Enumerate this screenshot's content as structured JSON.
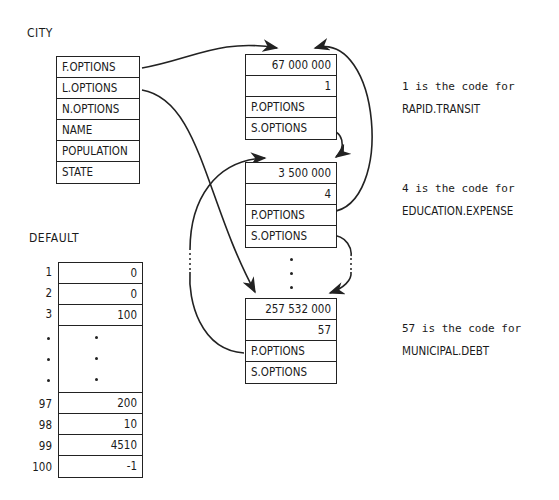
{
  "city": {
    "title": "CITY",
    "fields": [
      "F.OPTIONS",
      "L.OPTIONS",
      "N.OPTIONS",
      "NAME",
      "POPULATION",
      "STATE"
    ]
  },
  "options": [
    {
      "amount": "67 000 000",
      "code": "1",
      "p": "P.OPTIONS",
      "s": "S.OPTIONS",
      "note_l1": "1 is the code for",
      "note_l2": "RAPID.TRANSIT"
    },
    {
      "amount": "3 500 000",
      "code": "4",
      "p": "P.OPTIONS",
      "s": "S.OPTIONS",
      "note_l1": "4 is the code for",
      "note_l2": "EDUCATION.EXPENSE"
    },
    {
      "amount": "257 532 000",
      "code": "57",
      "p": "P.OPTIONS",
      "s": "S.OPTIONS",
      "note_l1": "57 is the code for",
      "note_l2": "MUNICIPAL.DEBT"
    }
  ],
  "default": {
    "title": "DEFAULT",
    "top": [
      {
        "i": "1",
        "v": "0"
      },
      {
        "i": "2",
        "v": "0"
      },
      {
        "i": "3",
        "v": "100"
      }
    ],
    "bottom": [
      {
        "i": "97",
        "v": "200"
      },
      {
        "i": "98",
        "v": "10"
      },
      {
        "i": "99",
        "v": "4510"
      },
      {
        "i": "100",
        "v": "-1"
      }
    ]
  }
}
